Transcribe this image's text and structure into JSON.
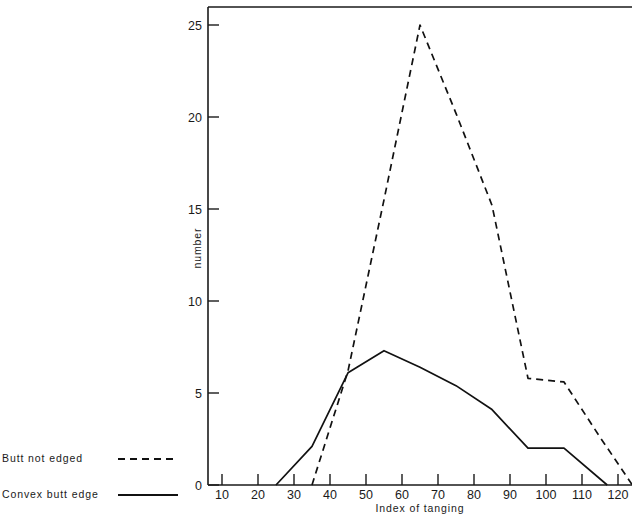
{
  "chart_data": {
    "type": "line",
    "title": "",
    "subtitle": "",
    "xlabel": "Index of tanging",
    "ylabel": "number",
    "xlim": [
      5,
      125
    ],
    "ylim": [
      0,
      26
    ],
    "xticks": [
      10,
      20,
      30,
      40,
      50,
      60,
      70,
      80,
      90,
      100,
      110,
      120
    ],
    "yticks": [
      0,
      5,
      10,
      15,
      20,
      25
    ],
    "xtick_labels": [
      "10",
      "20",
      "30",
      "40",
      "50",
      "60",
      "70",
      "80",
      "90",
      "100",
      "110",
      "120"
    ],
    "ytick_labels": [
      "0",
      "5",
      "10",
      "15",
      "20",
      "25"
    ],
    "grid": false,
    "legend_position": "outside-left-bottom",
    "series": [
      {
        "name": "Butt not edged",
        "style": "dashed",
        "color": "#111111",
        "x": [
          35,
          45,
          55,
          65,
          75,
          85,
          95,
          105,
          115,
          124
        ],
        "values": [
          0,
          6.2,
          15.5,
          25,
          20.2,
          15.2,
          5.8,
          5.6,
          2.6,
          0
        ]
      },
      {
        "name": "Convex butt edge",
        "style": "solid",
        "color": "#111111",
        "x": [
          25,
          35,
          45,
          55,
          65,
          75,
          85,
          95,
          105,
          117
        ],
        "values": [
          0,
          2.1,
          6.1,
          7.3,
          6.4,
          5.4,
          4.1,
          2.0,
          2.0,
          0
        ]
      }
    ]
  },
  "legend": {
    "entries": [
      {
        "label": "Butt not edged",
        "style": "dashed"
      },
      {
        "label": "Convex butt edge",
        "style": "solid"
      }
    ]
  },
  "axes": {
    "x_title": "Index of tanging",
    "y_title": "number"
  }
}
